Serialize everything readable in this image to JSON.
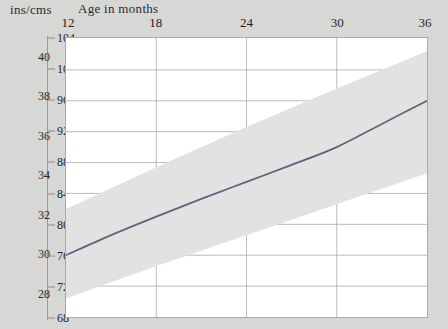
{
  "header": {
    "unit_label": "ins/cms",
    "age_label": "Age in months"
  },
  "chart_data": {
    "type": "line",
    "title": "Age in months",
    "xlabel": "Age in months",
    "ylabel": "ins/cms",
    "grid": true,
    "legend": "none",
    "x": [
      12,
      18,
      24,
      30,
      36
    ],
    "xlim": [
      12,
      36
    ],
    "x_tick_labels": [
      "12",
      "18",
      "24",
      "30",
      "36"
    ],
    "y_axis_primary": {
      "name": "ins",
      "unit": "inches",
      "ticks": [
        28,
        30,
        32,
        34,
        36,
        38,
        40
      ],
      "tick_labels": [
        "28",
        "30",
        "32",
        "34",
        "36",
        "38",
        "40"
      ],
      "ylim": [
        27.2,
        41.0
      ]
    },
    "y_axis_secondary": {
      "name": "cms",
      "unit": "centimetres",
      "ticks": [
        68,
        72,
        76,
        80,
        84,
        88,
        92,
        96,
        100,
        104
      ],
      "tick_labels": [
        "68",
        "72",
        "76",
        "80",
        "84",
        "88",
        "92",
        "96",
        "100",
        "104"
      ],
      "ylim": [
        68,
        104
      ]
    },
    "series": [
      {
        "name": "median",
        "units": "cm",
        "color": "#63607a",
        "x": [
          12,
          15,
          18,
          21,
          24,
          27,
          30,
          33,
          36
        ],
        "values": [
          76.0,
          78.6,
          81.0,
          83.3,
          85.5,
          87.7,
          90.0,
          93.0,
          96.0
        ]
      },
      {
        "name": "normal-range-upper",
        "units": "cm",
        "color": "#e2e2e2",
        "x": [
          12,
          18,
          24,
          30,
          36
        ],
        "values": [
          82.0,
          87.4,
          92.6,
          97.6,
          102.4
        ]
      },
      {
        "name": "normal-range-lower",
        "units": "cm",
        "color": "#e2e2e2",
        "x": [
          12,
          18,
          24,
          30,
          36
        ],
        "values": [
          70.4,
          74.6,
          78.6,
          82.6,
          86.6
        ]
      }
    ],
    "shaded_band": {
      "label": "normal-range-band",
      "color": "#e2e2e2"
    }
  }
}
